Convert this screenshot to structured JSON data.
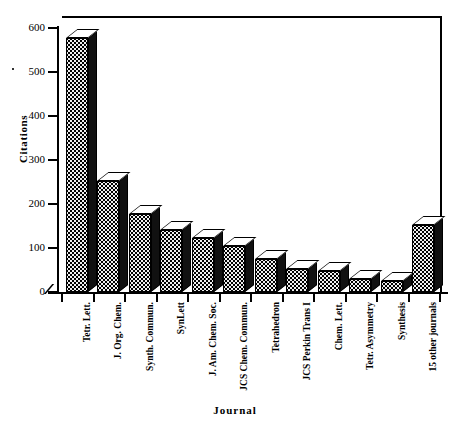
{
  "chart_data": {
    "type": "bar",
    "title": "",
    "xlabel": "Journal",
    "ylabel": "Citations",
    "ylim": [
      0,
      600
    ],
    "yticks": [
      0,
      100,
      200,
      300,
      400,
      500,
      600
    ],
    "grid": false,
    "legend": "none",
    "style": "3d-bar",
    "categories": [
      "Tetr. Lett.",
      "J. Org. Chem.",
      "Synth. Commun.",
      "SynLett",
      "J. Am. Chem. Soc.",
      "JCS Chem. Commun.",
      "Tetrahedron",
      "JCS Perkin Trans I",
      "Chem. Lett.",
      "Tetr. Asymmetry",
      "Synthesis",
      "15 other journals"
    ],
    "values": [
      577,
      253,
      178,
      140,
      122,
      105,
      75,
      52,
      48,
      30,
      25,
      152
    ]
  },
  "axes": {
    "y_title": "Citations",
    "x_title": "Journal",
    "y_tick_labels": [
      "0",
      "100",
      "200",
      "300",
      "400",
      "500",
      "600"
    ]
  },
  "colors": {
    "bar_front": "#efefef",
    "bar_pattern": "#000000",
    "bar_side": "#111111",
    "bar_top": "#ffffff",
    "axis": "#000000",
    "background": "#ffffff"
  }
}
